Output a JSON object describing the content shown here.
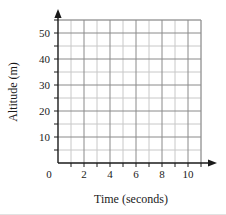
{
  "chart_data": {
    "type": "line",
    "title": "",
    "subtitle": "",
    "xlabel": "Time (seconds)",
    "ylabel": "Altitude (m)",
    "xlim": [
      0,
      11
    ],
    "ylim": [
      0,
      55
    ],
    "grid": true,
    "legend": null,
    "series": [],
    "x_major_ticks": [
      0,
      2,
      4,
      6,
      8,
      10
    ],
    "x_minor_ticks": [
      1,
      3,
      5,
      7,
      9,
      11
    ],
    "x_tick_labels": [
      "0",
      "2",
      "4",
      "6",
      "8",
      "10"
    ],
    "y_major_ticks": [
      10,
      20,
      30,
      40,
      50
    ],
    "y_minor_ticks": [
      5,
      15,
      25,
      35,
      45,
      55
    ],
    "y_tick_labels": [
      "10",
      "20",
      "30",
      "40",
      "50"
    ],
    "x_gridline_step": 1,
    "y_gridline_step": 5,
    "annotations": [],
    "note": "Empty coordinate grid with no plotted data points"
  },
  "axes": {
    "x_axis_name": "time-axis",
    "y_axis_name": "altitude-axis",
    "origin_label": "0",
    "x_arrow": "right-arrow",
    "y_arrow": "up-arrow"
  },
  "colors": {
    "grid_major": "#8a8a8a",
    "grid_minor": "#c8c8c8",
    "axis": "#1a1a1a",
    "text": "#1a1a1a",
    "background": "#ffffff"
  }
}
